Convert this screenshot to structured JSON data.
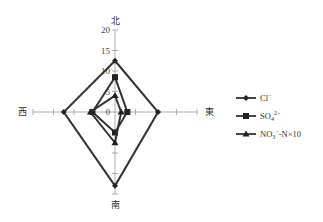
{
  "chart_data": {
    "type": "radar",
    "title": "",
    "axes": [
      "北",
      "東",
      "南",
      "西"
    ],
    "axes_order_note": "clockwise from top",
    "rlim": [
      0,
      20
    ],
    "ticks": [
      0,
      5,
      10,
      15,
      20
    ],
    "tick_labels": [
      "0",
      "5",
      "10",
      "15",
      "20"
    ],
    "series": [
      {
        "name": "Cl⁻",
        "marker": "diamond",
        "values": [
          12.5,
          10.5,
          18,
          12.5
        ]
      },
      {
        "name": "SO₄²⁻",
        "marker": "square",
        "values": [
          8.5,
          3,
          5,
          5.5
        ]
      },
      {
        "name": "NO₃⁻-N×10",
        "marker": "triangle",
        "values": [
          4,
          1.5,
          7.5,
          6
        ]
      }
    ],
    "legend_position": "right",
    "grid": false
  },
  "labels": {
    "north": "北",
    "east": "東",
    "south": "南",
    "west": "西"
  },
  "legend": [
    {
      "label": "Cl",
      "sup": "−"
    },
    {
      "label": "SO",
      "sub": "4",
      "sup": "2−"
    },
    {
      "label": "NO",
      "sub": "3",
      "sup": "−",
      "suffix": "-N×10"
    }
  ]
}
